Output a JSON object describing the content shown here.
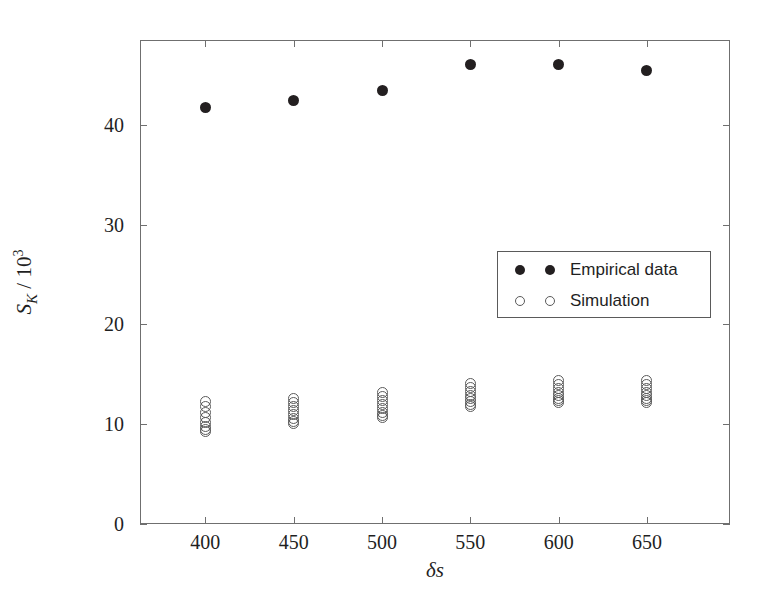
{
  "chart_data": {
    "type": "scatter",
    "title": "",
    "xlabel": "δs",
    "ylabel_text": "S_K / 10^3",
    "ylabel_main": "S",
    "ylabel_sub": "K",
    "ylabel_divider": " / 10",
    "ylabel_sup": "3",
    "xlim": [
      363,
      697
    ],
    "ylim": [
      0,
      48.5
    ],
    "xticks": [
      400,
      450,
      500,
      550,
      600,
      650
    ],
    "xticklabels": [
      "400",
      "450",
      "500",
      "550",
      "600",
      "650"
    ],
    "yticks": [
      0,
      10,
      20,
      30,
      40
    ],
    "yticklabels": [
      "0",
      "10",
      "20",
      "30",
      "40"
    ],
    "grid": false,
    "legend_position": "center-right",
    "x": [
      400,
      450,
      500,
      550,
      600,
      650
    ],
    "series": [
      {
        "name": "Empirical data",
        "marker": "filled-circle",
        "color": "#231f20",
        "values": [
          41.7,
          42.4,
          43.4,
          46.0,
          46.0,
          45.4
        ]
      },
      {
        "name": "Simulation",
        "marker": "open-circle",
        "color": "#5a5a5a",
        "clusters": [
          {
            "x": 400,
            "values": [
              12.3,
              11.8,
              11.2,
              10.7,
              10.2,
              9.8,
              9.5,
              9.3
            ]
          },
          {
            "x": 450,
            "values": [
              12.6,
              12.2,
              11.8,
              11.4,
              11.0,
              10.6,
              10.3,
              10.1
            ]
          },
          {
            "x": 500,
            "values": [
              13.2,
              12.8,
              12.4,
              12.0,
              11.6,
              11.2,
              10.9,
              10.7
            ]
          },
          {
            "x": 550,
            "values": [
              14.1,
              13.7,
              13.3,
              12.9,
              12.6,
              12.3,
              12.0,
              11.8
            ]
          },
          {
            "x": 600,
            "values": [
              14.4,
              14.0,
              13.6,
              13.2,
              12.9,
              12.6,
              12.4,
              12.2
            ]
          },
          {
            "x": 650,
            "values": [
              14.4,
              14.0,
              13.6,
              13.2,
              12.9,
              12.6,
              12.4,
              12.2
            ]
          }
        ]
      }
    ]
  },
  "legend": {
    "entries": [
      {
        "label": "Empirical data",
        "marker": "filled-circle"
      },
      {
        "label": "Simulation",
        "marker": "open-circle"
      }
    ]
  }
}
